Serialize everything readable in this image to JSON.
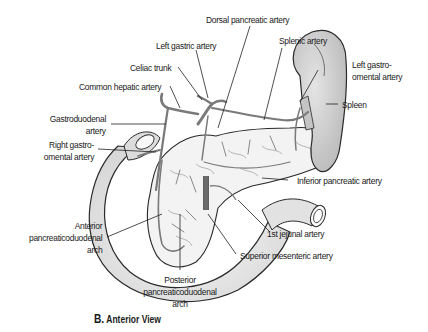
{
  "figure": {
    "panel_letter": "B.",
    "view_title": "Anterior View",
    "colors": {
      "background": "#ffffff",
      "outline": "#2a2a2a",
      "organ_fill": "#e6e6e6",
      "pancreas_fill": "#f2f2f2",
      "spleen_fill": "#cfcfcf",
      "artery": "#7a7a7a",
      "leader_line": "#222222"
    }
  },
  "labels": {
    "dorsal_pancreatic": "Dorsal pancreatic artery",
    "left_gastric": "Left gastric artery",
    "splenic": "Splenic artery",
    "celiac_trunk": "Celiac trunk",
    "common_hepatic": "Common hepatic artery",
    "left_gastro_omental_1": "Left gastro-",
    "left_gastro_omental_2": "omental artery",
    "spleen": "Spleen",
    "gastroduodenal_1": "Gastroduodenal",
    "gastroduodenal_2": "artery",
    "right_gastro_omental_1": "Right gastro-",
    "right_gastro_omental_2": "omental artery",
    "inferior_pancreatic": "Inferior pancreatic artery",
    "anterior_arch_1": "Anterior",
    "anterior_arch_2": "pancreaticoduodenal",
    "anterior_arch_3": "arch",
    "first_jejunal": "1st jejunal artery",
    "superior_mesenteric": "Superior mesenteric artery",
    "posterior_arch_1": "Posterior",
    "posterior_arch_2": "pancreaticoduodenal",
    "posterior_arch_3": "arch"
  }
}
